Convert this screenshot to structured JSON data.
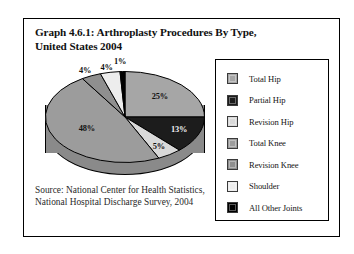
{
  "figure": {
    "title_line1": "Graph 4.6.1: Arthroplasty Procedures By Type,",
    "title_line2": "United States 2004",
    "source_line1": "Source: National Center for Health Statistics,",
    "source_line2": "National Hospital Discharge Survey, 2004"
  },
  "chart_data": {
    "type": "pie",
    "title": "Graph 4.6.1: Arthroplasty Procedures By Type, United States 2004",
    "xlabel": "",
    "ylabel": "",
    "legend_position": "right",
    "grid": false,
    "three_d": true,
    "start_angle_deg": 0,
    "direction": "clockwise",
    "categories": [
      "Total Hip",
      "Partial Hip",
      "Revision Hip",
      "Total Knee",
      "Revision Knee",
      "Shoulder",
      "All Other Joints"
    ],
    "values": [
      25,
      13,
      5,
      48,
      4,
      4,
      1
    ],
    "value_unit": "%",
    "data_labels": [
      "25%",
      "13%",
      "5%",
      "48%",
      "4%",
      "4%",
      "1%"
    ],
    "colors": [
      "#a6a6a6",
      "#1c1c1c",
      "#d9d9d9",
      "#9c9c9c",
      "#8f8f8f",
      "#ededed",
      "#000000"
    ],
    "label_text_colors": [
      "#111111",
      "#f2f2f2",
      "#111111",
      "#111111",
      "#111111",
      "#111111",
      "#111111"
    ]
  },
  "legend": {
    "items": [
      {
        "label": "Total Hip",
        "color": "#a6a6a6"
      },
      {
        "label": "Partial Hip",
        "color": "#1c1c1c"
      },
      {
        "label": "Revision Hip",
        "color": "#d9d9d9"
      },
      {
        "label": "Total Knee",
        "color": "#9c9c9c"
      },
      {
        "label": "Revision Knee",
        "color": "#8f8f8f"
      },
      {
        "label": "Shoulder",
        "color": "#ededed"
      },
      {
        "label": "All Other Joints",
        "color": "#000000"
      }
    ]
  }
}
